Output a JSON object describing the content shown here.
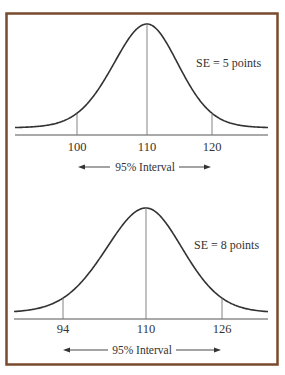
{
  "colors": {
    "frame": "#7a4a2e",
    "curve": "#333333",
    "text": "#333333"
  },
  "chart_data": [
    {
      "type": "line",
      "title": "",
      "annotation": "SE = 5 points",
      "mean": 110,
      "se": 5,
      "x_ticks": [
        100,
        110,
        120
      ],
      "x_tick_labels": [
        "100",
        "110",
        "120"
      ],
      "interval_label": "95% Interval",
      "interval": [
        100,
        120
      ],
      "xlabel": "",
      "ylabel": "",
      "grid": false,
      "distribution": "normal"
    },
    {
      "type": "line",
      "title": "",
      "annotation": "SE = 8 points",
      "mean": 110,
      "se": 8,
      "x_ticks": [
        94,
        110,
        126
      ],
      "x_tick_labels": [
        "94",
        "110",
        "126"
      ],
      "interval_label": "95% Interval",
      "interval": [
        94,
        126
      ],
      "xlabel": "",
      "ylabel": "",
      "grid": false,
      "distribution": "normal"
    }
  ],
  "panels": [
    {
      "annotation": "SE = 5 points",
      "ticks": [
        "100",
        "110",
        "120"
      ],
      "interval_label": "95% Interval"
    },
    {
      "annotation": "SE = 8 points",
      "ticks": [
        "94",
        "110",
        "126"
      ],
      "interval_label": "95% Interval"
    }
  ]
}
